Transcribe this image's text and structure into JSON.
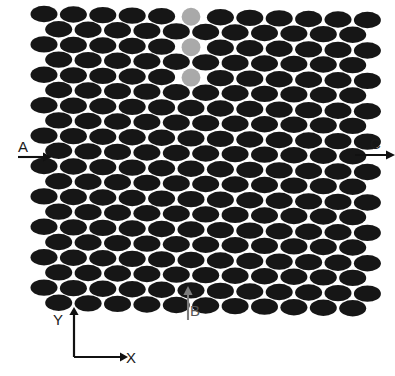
{
  "figure": {
    "background_color": "#ffffff"
  },
  "labels": {
    "port_a": "A",
    "port_b": "B",
    "port_c": "C",
    "axis_x": "X",
    "axis_y": "Y"
  },
  "colors": {
    "rod_dark": "#161616",
    "rod_gray": "#a9a9a9",
    "rod_center_gray": "#9a9a9a",
    "arrow_dark": "#111111",
    "arrow_gray": "#7d7d7d",
    "axis": "#111111",
    "text": "#1a1a1a",
    "text_gray": "#555555"
  },
  "lattice": {
    "type": "hexagonal-staggered",
    "rows": 20,
    "columns_even": 12,
    "columns_odd": 12,
    "rod_shape": "ellipse",
    "rod_rx": 13.5,
    "rod_ry": 8.2,
    "row_pitch": 15.2,
    "col_pitch": 29.4,
    "origin_x": 44,
    "origin_y": 14,
    "row_stagger": 14.7,
    "tilt_per_row_px": 0.55,
    "defect_row_index": 9,
    "defect_col_index": 5
  },
  "defects": {
    "horizontal_channel": {
      "label": "A-C waveguide",
      "row": 9,
      "gray_columns_left": [
        0,
        1,
        2
      ],
      "dark_columns_left": [
        3,
        4
      ],
      "center_column": 5,
      "dark_columns_right": [
        6,
        7
      ],
      "gray_columns_right": [
        8,
        9,
        10,
        11
      ]
    },
    "vertical_channel": {
      "label": "B waveguide",
      "column": 5,
      "gray_rows_above": [
        0,
        2,
        4
      ],
      "gray_rows_below": [
        15,
        17,
        19
      ]
    },
    "center_rod": {
      "label": "rotated central rod",
      "orientation": "vertical",
      "rx": 8.4,
      "ry": 14.0
    }
  },
  "arrows": {
    "a": {
      "label": "A",
      "direction": "right",
      "x1": 18,
      "y1": 157,
      "x2": 46,
      "y2": 157
    },
    "c": {
      "label": "C",
      "direction": "right",
      "x1": 355,
      "y1": 155,
      "x2": 389,
      "y2": 155
    },
    "b": {
      "label": "B",
      "direction": "up",
      "x1": 188,
      "y1": 320,
      "x2": 188,
      "y2": 292
    }
  },
  "axes_indicator": {
    "x_label": "X",
    "y_label": "Y",
    "corner_x": 74,
    "corner_y": 357,
    "x_end": 122,
    "y_end": 313
  }
}
